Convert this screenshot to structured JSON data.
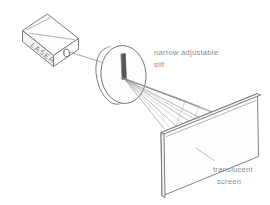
{
  "diagram": {
    "background_color": "#ffffff",
    "line_color": "#6d6d72",
    "text_color": "#8a8a90"
  },
  "laser": {
    "body_label": "LASER",
    "aperture_icon": "laser-aperture-icon"
  },
  "slit": {
    "label_line1": "narrow adjustable",
    "label_line2": "slit",
    "icon": "slit-disk-icon"
  },
  "screen": {
    "label_line1": "translucent",
    "label_line2": "screen",
    "icon": "screen-panel-icon"
  },
  "beam": {
    "name": "incident-laser-beam",
    "ray_count": 14
  }
}
